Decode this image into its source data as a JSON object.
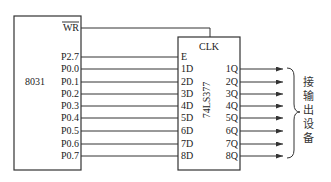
{
  "mcu": {
    "name": "8031",
    "pins": [
      {
        "label": "WR",
        "overline": true,
        "y": 28
      },
      {
        "label": "P2.7",
        "y": 57
      },
      {
        "label": "P0.0",
        "y": 69
      },
      {
        "label": "P0.1",
        "y": 82
      },
      {
        "label": "P0.2",
        "y": 94
      },
      {
        "label": "P0.3",
        "y": 106
      },
      {
        "label": "P0.4",
        "y": 118
      },
      {
        "label": "P0.5",
        "y": 131
      },
      {
        "label": "P0.6",
        "y": 144
      },
      {
        "label": "P0.7",
        "y": 156
      }
    ]
  },
  "latch": {
    "name": "74LS377",
    "clk_label": "CLK",
    "inputs": [
      "E",
      "1D",
      "2D",
      "3D",
      "4D",
      "5D",
      "6D",
      "7D",
      "8D"
    ],
    "outputs": [
      "1Q",
      "2Q",
      "3Q",
      "4Q",
      "5Q",
      "6Q",
      "7Q",
      "8Q"
    ]
  },
  "output_device": {
    "label_chars": [
      "接",
      "输",
      "出",
      "设",
      "备"
    ]
  },
  "colors": {
    "line": "#333333",
    "text": "#222222",
    "background": "#ffffff"
  }
}
